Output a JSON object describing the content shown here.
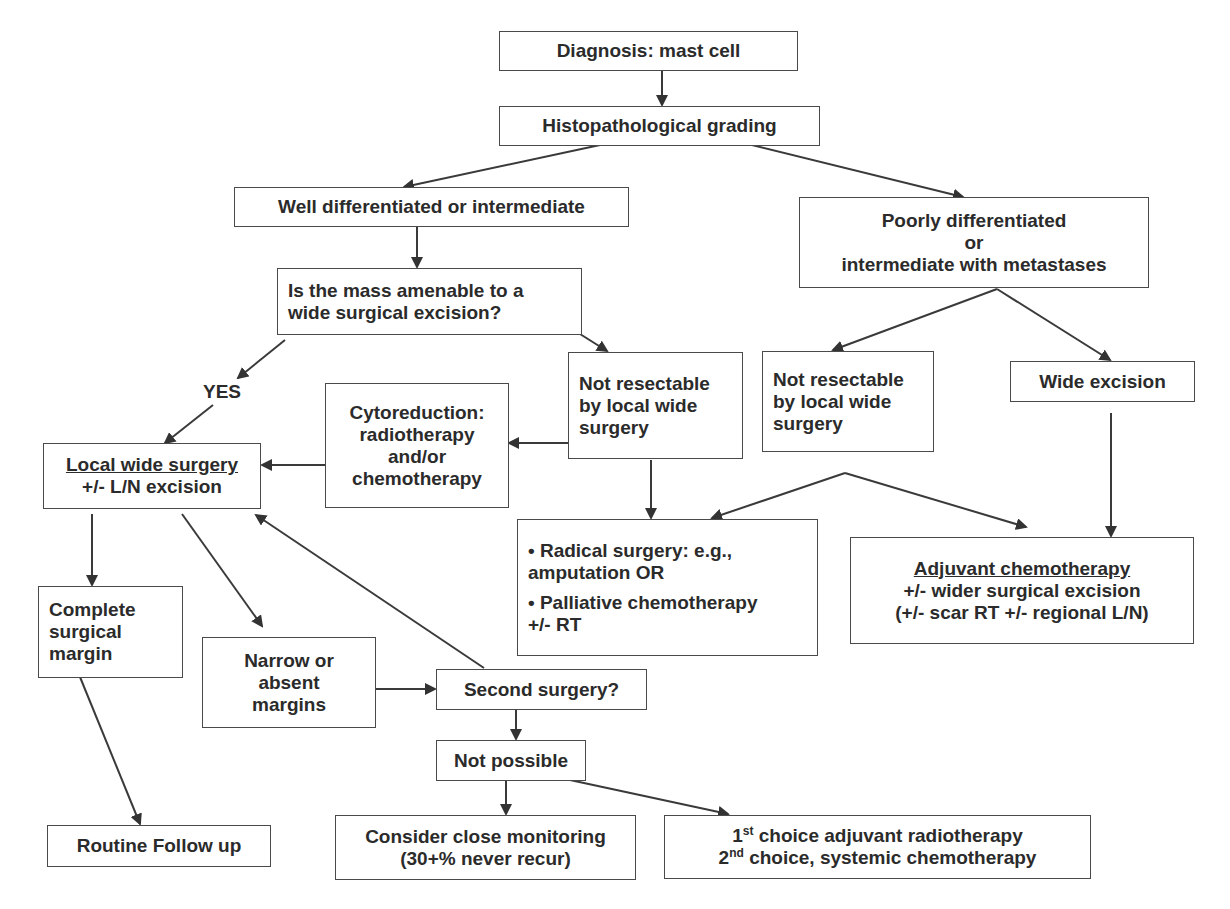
{
  "diagram": {
    "type": "flowchart",
    "nodes": {
      "diagnosis": {
        "lines": [
          "Diagnosis: mast cell"
        ]
      },
      "grading": {
        "lines": [
          "Histopathological grading"
        ]
      },
      "well_diff": {
        "lines": [
          "Well differentiated or intermediate"
        ]
      },
      "poorly_diff": {
        "lines": [
          "Poorly differentiated",
          "or",
          "intermediate with metastases"
        ]
      },
      "amenable": {
        "lines": [
          "Is the mass amenable to a",
          "wide surgical excision?"
        ]
      },
      "not_resectable_1": {
        "lines": [
          "Not resectable",
          "by local wide",
          "surgery"
        ]
      },
      "not_resectable_2": {
        "lines": [
          "Not resectable",
          "by local wide",
          "surgery"
        ]
      },
      "wide_excision": {
        "lines": [
          "Wide excision"
        ]
      },
      "cytoreduction": {
        "lines": [
          "Cytoreduction:",
          "radiotherapy",
          "and/or",
          "chemotherapy"
        ]
      },
      "local_wide": {
        "title": "Local wide surgery",
        "lines": [
          "+/- L/N excision"
        ]
      },
      "radical": {
        "bullets": [
          "Radical surgery: e.g.,",
          "amputation OR",
          "Palliative chemotherapy",
          "+/- RT"
        ]
      },
      "adjuvant": {
        "title": "Adjuvant chemotherapy",
        "lines": [
          "+/- wider surgical excision",
          "(+/- scar RT +/- regional L/N)"
        ]
      },
      "complete_margin": {
        "lines": [
          "Complete",
          "surgical",
          "margin"
        ]
      },
      "narrow_margin": {
        "lines": [
          "Narrow or",
          "absent",
          "margins"
        ]
      },
      "second_surgery": {
        "lines": [
          "Second surgery?"
        ]
      },
      "not_possible": {
        "lines": [
          "Not possible"
        ]
      },
      "routine": {
        "lines": [
          "Routine Follow up"
        ]
      },
      "monitoring": {
        "lines": [
          "Consider close monitoring",
          "(30+% never recur)"
        ]
      },
      "choices": {
        "line1": {
          "num": "1",
          "sup": "st",
          "text": " choice adjuvant radiotherapy"
        },
        "line2": {
          "num": "2",
          "sup": "nd",
          "text": " choice, systemic chemotherapy"
        }
      }
    },
    "edge_labels": {
      "yes": "YES"
    },
    "edges": [
      [
        "diagnosis",
        "grading"
      ],
      [
        "grading",
        "well_diff"
      ],
      [
        "grading",
        "poorly_diff"
      ],
      [
        "well_diff",
        "amenable"
      ],
      [
        "amenable",
        "local_wide",
        "YES"
      ],
      [
        "amenable",
        "not_resectable_1"
      ],
      [
        "not_resectable_1",
        "cytoreduction"
      ],
      [
        "cytoreduction",
        "local_wide"
      ],
      [
        "not_resectable_1",
        "radical"
      ],
      [
        "poorly_diff",
        "not_resectable_2"
      ],
      [
        "poorly_diff",
        "wide_excision"
      ],
      [
        "not_resectable_2",
        "radical"
      ],
      [
        "not_resectable_2",
        "adjuvant"
      ],
      [
        "wide_excision",
        "adjuvant"
      ],
      [
        "local_wide",
        "complete_margin"
      ],
      [
        "local_wide",
        "narrow_margin"
      ],
      [
        "narrow_margin",
        "second_surgery"
      ],
      [
        "second_surgery",
        "local_wide"
      ],
      [
        "second_surgery",
        "not_possible"
      ],
      [
        "complete_margin",
        "routine"
      ],
      [
        "not_possible",
        "monitoring"
      ],
      [
        "not_possible",
        "choices"
      ]
    ],
    "colors": {
      "stroke": "#4a4a4a",
      "text": "#2b2b2b",
      "background": "#ffffff"
    }
  }
}
